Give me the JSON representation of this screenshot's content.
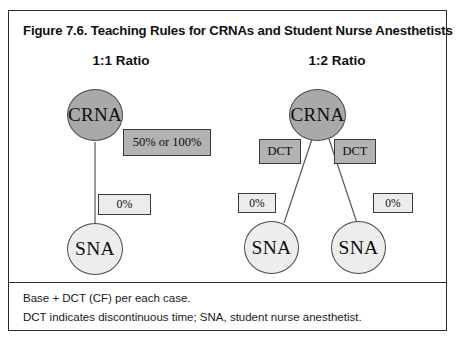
{
  "figure": {
    "title": "Figure 7.6. Teaching Rules for CRNAs and Student Nurse Anesthetists",
    "panels": [
      {
        "header": "1:1 Ratio",
        "crna_label": "CRNA",
        "percent_box": "50% or 100%",
        "sna_box": "0%",
        "sna_label": "SNA"
      },
      {
        "header": "1:2 Ratio",
        "crna_label": "CRNA",
        "dct_left": "DCT",
        "dct_right": "DCT",
        "sna_box_left": "0%",
        "sna_box_right": "0%",
        "sna_label_left": "SNA",
        "sna_label_right": "SNA"
      }
    ],
    "footnotes": [
      "Base + DCT (CF) per each case.",
      "DCT indicates discontinuous time; SNA, student nurse anesthetist."
    ]
  },
  "colors": {
    "frame_border": "#2b2b2b",
    "crna_fill": "#a9a9a9",
    "sna_fill": "#ededed",
    "dct_fill": "#b3b3b3",
    "percent_fill": "#b3b3b3",
    "zero_fill": "#ececec",
    "text": "#111111"
  }
}
